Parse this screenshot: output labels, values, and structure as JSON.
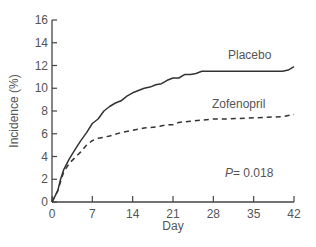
{
  "chart_data": {
    "type": "line",
    "title": "",
    "xlabel": "Day",
    "ylabel": "Incidence (%)",
    "xlim": [
      0,
      42
    ],
    "ylim": [
      0,
      16
    ],
    "x_ticks": [
      "0",
      "7",
      "14",
      "21",
      "28",
      "35",
      "42"
    ],
    "y_ticks": [
      "0",
      "2",
      "4",
      "6",
      "8",
      "10",
      "12",
      "14",
      "16"
    ],
    "grid": false,
    "series": [
      {
        "name": "Placebo",
        "style": "solid",
        "x": [
          0,
          0.5,
          1,
          1.5,
          2,
          3,
          4,
          5,
          6,
          7,
          8,
          9,
          10,
          11,
          12,
          13,
          14,
          15,
          16,
          17,
          18,
          19,
          20,
          21,
          22,
          23,
          24,
          25,
          26,
          28,
          35,
          40,
          41,
          42
        ],
        "values": [
          0,
          0.5,
          1.0,
          2.0,
          2.8,
          3.8,
          4.6,
          5.4,
          6.1,
          6.9,
          7.3,
          8.0,
          8.4,
          8.7,
          8.9,
          9.3,
          9.6,
          9.8,
          10.0,
          10.1,
          10.3,
          10.4,
          10.7,
          10.9,
          10.9,
          11.2,
          11.2,
          11.3,
          11.5,
          11.5,
          11.5,
          11.5,
          11.6,
          11.9
        ]
      },
      {
        "name": "Zofenopril",
        "style": "dashed",
        "x": [
          0,
          0.5,
          1,
          1.5,
          2,
          3,
          4,
          5,
          6,
          7,
          8,
          9,
          10,
          12,
          14,
          16,
          18,
          20,
          21,
          22,
          24,
          26,
          28,
          30,
          35,
          40,
          42
        ],
        "values": [
          0,
          0.5,
          1.0,
          1.8,
          2.6,
          3.4,
          3.9,
          4.4,
          5.0,
          5.4,
          5.6,
          5.7,
          5.8,
          6.1,
          6.3,
          6.5,
          6.6,
          6.8,
          6.8,
          7.0,
          7.1,
          7.2,
          7.3,
          7.3,
          7.4,
          7.5,
          7.7
        ]
      }
    ],
    "annotations": [
      {
        "text": "P = 0.018",
        "x": 28,
        "y": 1.8
      }
    ],
    "legend": "inline labels"
  },
  "labels": {
    "placebo": "Placebo",
    "zofenopril": "Zofenopril",
    "p_prefix": "P",
    "p_value": "= 0.018",
    "xlabel": "Day",
    "ylabel": "Incidence (%)"
  },
  "colors": {
    "axis": "#444444",
    "line": "#333333",
    "text": "#555555"
  }
}
